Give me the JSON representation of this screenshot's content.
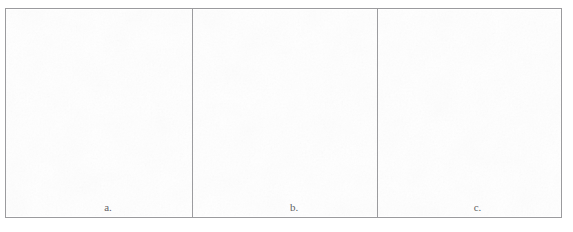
{
  "document": {
    "caption_line": "— ——— —————",
    "background_color": "#ffffff",
    "border_color": "#9b9b9e",
    "label_color": "#5e5e62"
  },
  "figure": {
    "panel_count": 3,
    "panels": [
      {
        "id": "a",
        "label": "a.",
        "content": ""
      },
      {
        "id": "b",
        "label": "b.",
        "content": ""
      },
      {
        "id": "c",
        "label": "c.",
        "content": ""
      }
    ]
  }
}
